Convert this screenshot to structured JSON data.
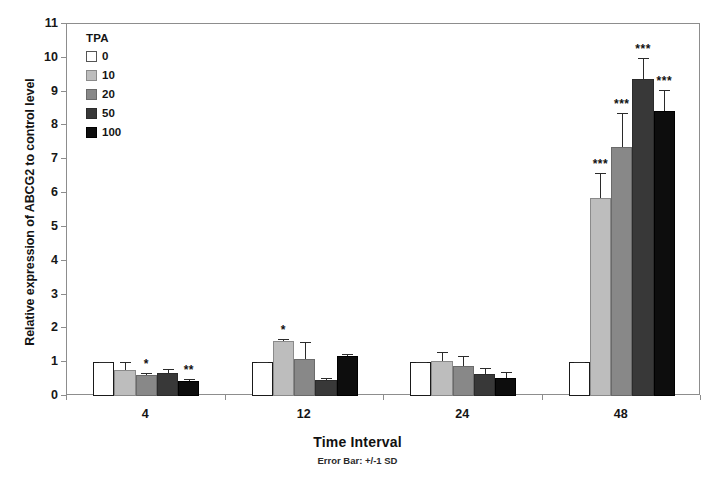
{
  "chart_data": {
    "type": "bar",
    "title": "",
    "xlabel": "Time Interval",
    "xsublabel": "Error Bar: +/-1 SD",
    "ylabel": "Relative expression of ABCG2 to control level",
    "ylim": [
      0,
      11
    ],
    "yticks": [
      0,
      1,
      2,
      3,
      4,
      5,
      6,
      7,
      8,
      9,
      10,
      11
    ],
    "grid": false,
    "legend_title": "TPA",
    "legend_position": "inside-top-left",
    "categories": [
      "4",
      "12",
      "24",
      "48"
    ],
    "series": [
      {
        "name": "0",
        "color": "#ffffff",
        "border": "#1a1a1a",
        "values": [
          1.0,
          1.0,
          1.0,
          1.0
        ],
        "errors": [
          0.0,
          0.0,
          0.0,
          0.0
        ],
        "significance": [
          "",
          "",
          "",
          ""
        ]
      },
      {
        "name": "10",
        "color": "#bdbdbd",
        "border": "#8a8a8a",
        "values": [
          0.78,
          1.62,
          1.03,
          5.85
        ],
        "errors": [
          0.22,
          0.07,
          0.27,
          0.75
        ],
        "significance": [
          "",
          "*",
          "",
          "***"
        ]
      },
      {
        "name": "20",
        "color": "#888888",
        "border": "#6a6a6a",
        "values": [
          0.62,
          1.08,
          0.9,
          7.37
        ],
        "errors": [
          0.05,
          0.52,
          0.27,
          1.0
        ],
        "significance": [
          "*",
          "",
          "",
          "***"
        ]
      },
      {
        "name": "50",
        "color": "#383838",
        "border": "#2b2b2b",
        "values": [
          0.68,
          0.48,
          0.65,
          9.38
        ],
        "errors": [
          0.12,
          0.05,
          0.17,
          0.62
        ],
        "significance": [
          "",
          "",
          "",
          "***"
        ]
      },
      {
        "name": "100",
        "color": "#0d0d0d",
        "border": "#000000",
        "values": [
          0.45,
          1.18,
          0.53,
          8.42
        ],
        "errors": [
          0.05,
          0.05,
          0.17,
          0.62
        ],
        "significance": [
          "**",
          "",
          "",
          "***"
        ]
      }
    ]
  },
  "axis": {
    "y_title": "Relative expression of ABCG2 to control level",
    "x_title": "Time Interval",
    "x_subtitle": "Error Bar: +/-1 SD"
  },
  "legend": {
    "title": "TPA",
    "items": [
      {
        "label": "0"
      },
      {
        "label": "10"
      },
      {
        "label": "20"
      },
      {
        "label": "50"
      },
      {
        "label": "100"
      }
    ]
  }
}
